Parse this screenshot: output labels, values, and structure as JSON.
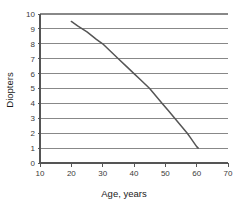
{
  "chart_data": {
    "type": "line",
    "title": "",
    "xlabel": "Age, years",
    "ylabel": "Diopters",
    "xlim": [
      10,
      70
    ],
    "ylim": [
      0,
      10
    ],
    "xticks": [
      10,
      20,
      30,
      40,
      50,
      60,
      70
    ],
    "yticks": [
      0,
      1,
      2,
      3,
      4,
      5,
      6,
      7,
      8,
      9,
      10
    ],
    "xtick_labels": [
      "10",
      "20",
      "30",
      "40",
      "50",
      "60",
      "70"
    ],
    "ytick_labels": [
      "0",
      "1",
      "2",
      "3",
      "4",
      "5",
      "6",
      "7",
      "8",
      "9",
      "10"
    ],
    "grid": "horizontal",
    "legend": "none",
    "series": [
      {
        "name": "Amplitude of accommodation",
        "x": [
          20,
          22,
          25,
          28,
          30,
          32,
          35,
          38,
          40,
          42,
          45,
          47,
          49,
          51,
          53,
          55,
          57,
          58,
          59,
          60,
          60.5
        ],
        "y": [
          9.5,
          9.2,
          8.8,
          8.3,
          8.0,
          7.6,
          7.0,
          6.4,
          6.0,
          5.6,
          5.0,
          4.5,
          4.0,
          3.5,
          3.0,
          2.5,
          2.0,
          1.7,
          1.4,
          1.1,
          1.0
        ]
      }
    ],
    "colors": {
      "curve": "#555555",
      "grid": "#888888",
      "axis": "#555555",
      "text": "#1a1a1a",
      "background": "#ffffff"
    }
  },
  "axes": {
    "x_label": "Age, years",
    "y_label": "Diopters"
  }
}
